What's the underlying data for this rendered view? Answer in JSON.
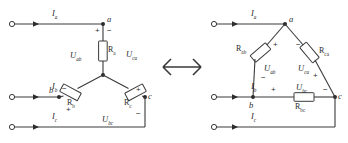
{
  "diagram": {
    "equivalence_symbol": "double-arrow",
    "line_color": "#3a3a3a",
    "text_color": "#2b2b2b"
  },
  "left_circuit": {
    "name": "wye-connection",
    "currents": [
      {
        "id": "Ia",
        "base": "I",
        "sub": "a"
      },
      {
        "id": "Ib",
        "base": "I",
        "sub": "b"
      },
      {
        "id": "Ic",
        "base": "I",
        "sub": "c"
      }
    ],
    "nodes": [
      {
        "id": "a",
        "label": "a"
      },
      {
        "id": "b",
        "label": "b"
      },
      {
        "id": "c",
        "label": "c"
      }
    ],
    "resistors": [
      {
        "id": "Ra",
        "base": "R",
        "sub": "a"
      },
      {
        "id": "Rb",
        "base": "R",
        "sub": "b"
      },
      {
        "id": "Rc",
        "base": "R",
        "sub": "c"
      }
    ],
    "voltages": [
      {
        "id": "Uab",
        "base": "U",
        "sub": "ab"
      },
      {
        "id": "Uca",
        "base": "U",
        "sub": "ca"
      },
      {
        "id": "Ubc",
        "base": "U",
        "sub": "bc"
      }
    ],
    "polarities": [
      {
        "id": "a-plus",
        "mark": "+"
      },
      {
        "id": "a-minus",
        "mark": "−"
      },
      {
        "id": "b-minus",
        "mark": "−"
      },
      {
        "id": "c-plus",
        "mark": "+"
      },
      {
        "id": "bc-plus",
        "mark": "+"
      },
      {
        "id": "bc-minus",
        "mark": "−"
      }
    ]
  },
  "right_circuit": {
    "name": "delta-connection",
    "currents": [
      {
        "id": "Ia",
        "base": "I",
        "sub": "a"
      },
      {
        "id": "Ib",
        "base": "I",
        "sub": "b"
      },
      {
        "id": "Ic",
        "base": "I",
        "sub": "c"
      }
    ],
    "nodes": [
      {
        "id": "a",
        "label": "a"
      },
      {
        "id": "b",
        "label": "b"
      },
      {
        "id": "c",
        "label": "c"
      }
    ],
    "resistors": [
      {
        "id": "Rab",
        "base": "R",
        "sub": "ab"
      },
      {
        "id": "Rca",
        "base": "R",
        "sub": "ca"
      },
      {
        "id": "Rbc",
        "base": "R",
        "sub": "bc"
      }
    ],
    "voltages": [
      {
        "id": "Uab",
        "base": "U",
        "sub": "ab"
      },
      {
        "id": "Uca",
        "base": "U",
        "sub": "ca"
      },
      {
        "id": "Ubc",
        "base": "U",
        "sub": "bc"
      }
    ],
    "polarities": [
      {
        "id": "ab-plus",
        "mark": "+"
      },
      {
        "id": "ab-minus",
        "mark": "−"
      },
      {
        "id": "ca-minus",
        "mark": "−"
      },
      {
        "id": "ca-plus",
        "mark": "+"
      },
      {
        "id": "bc-plus",
        "mark": "+"
      },
      {
        "id": "bc-minus",
        "mark": "−"
      }
    ]
  }
}
